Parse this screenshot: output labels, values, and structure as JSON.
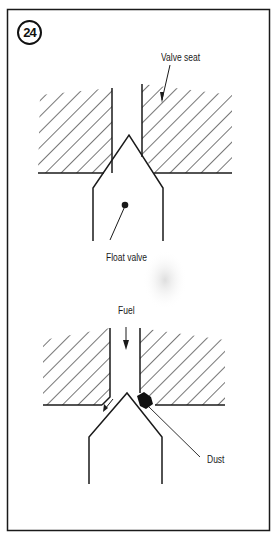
{
  "figure": {
    "number": "24",
    "top_diagram": {
      "labels": {
        "valve_seat": "Valve seat",
        "float_valve": "Float valve"
      }
    },
    "bottom_diagram": {
      "labels": {
        "fuel": "Fuel",
        "dust": "Dust"
      }
    }
  },
  "colors": {
    "line": "#1a1a1a",
    "background": "#ffffff",
    "smudge": "#c8c8c8"
  }
}
